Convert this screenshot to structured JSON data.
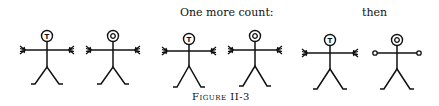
{
  "labels": {
    "one_more_count": "One more count:",
    "then": "then"
  },
  "caption": "Figure II-3",
  "figures": [
    {
      "id": 1,
      "head_letter": "T",
      "hands": "fingers"
    },
    {
      "id": 2,
      "head_letter": "O",
      "hands": "fingers"
    },
    {
      "id": 3,
      "head_letter": "T",
      "hands": "fingers"
    },
    {
      "id": 4,
      "head_letter": "O",
      "hands": "fingers"
    },
    {
      "id": 5,
      "head_letter": "T",
      "hands": "fingers"
    },
    {
      "id": 6,
      "head_letter": "O",
      "hands": "circles"
    }
  ]
}
